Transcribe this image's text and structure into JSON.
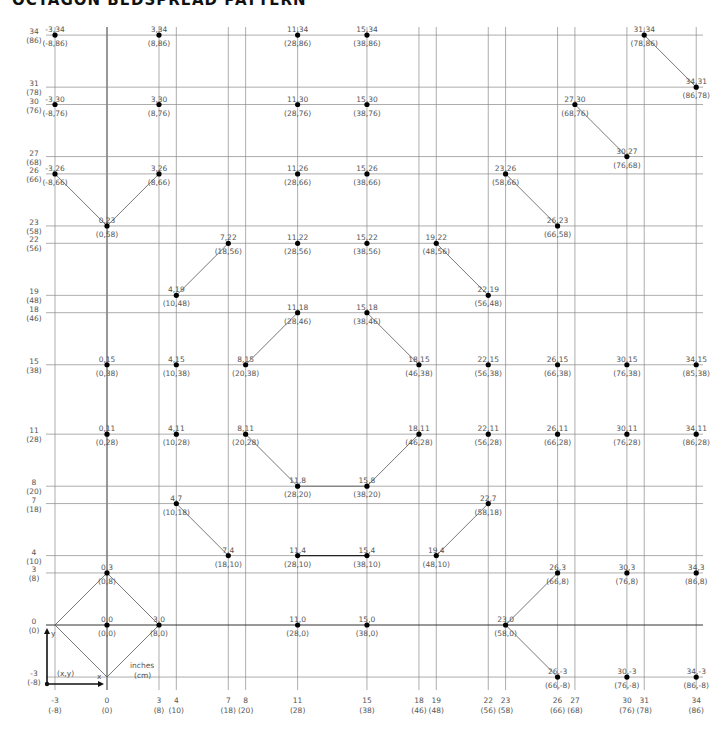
{
  "title": "OCTAGON BEDSPREAD PATTERN",
  "legend": {
    "xy_label": "(x,y)",
    "x_label": "x",
    "y_label": "y",
    "units_inches": "inches",
    "units_cm": "(cm)"
  },
  "axes": {
    "x_ticks": [
      {
        "v": -3,
        "in": "-3",
        "cm": "(-8)"
      },
      {
        "v": 0,
        "in": "0",
        "cm": "(0)"
      },
      {
        "v": 3,
        "in": "3",
        "cm": "(8)"
      },
      {
        "v": 4,
        "in": "4",
        "cm": "(10)"
      },
      {
        "v": 7,
        "in": "7",
        "cm": "(18)"
      },
      {
        "v": 8,
        "in": "8",
        "cm": "(20)"
      },
      {
        "v": 11,
        "in": "11",
        "cm": "(28)"
      },
      {
        "v": 15,
        "in": "15",
        "cm": "(38)"
      },
      {
        "v": 18,
        "in": "18",
        "cm": "(46)"
      },
      {
        "v": 19,
        "in": "19",
        "cm": "(48)"
      },
      {
        "v": 22,
        "in": "22",
        "cm": "(56)"
      },
      {
        "v": 23,
        "in": "23",
        "cm": "(58)"
      },
      {
        "v": 26,
        "in": "26",
        "cm": "(66)"
      },
      {
        "v": 27,
        "in": "27",
        "cm": "(68)"
      },
      {
        "v": 30,
        "in": "30",
        "cm": "(76)"
      },
      {
        "v": 31,
        "in": "31",
        "cm": "(78)"
      },
      {
        "v": 34,
        "in": "34",
        "cm": "(86)"
      }
    ],
    "y_ticks": [
      {
        "v": 34,
        "in": "34",
        "cm": "(86)"
      },
      {
        "v": 31,
        "in": "31",
        "cm": "(78)"
      },
      {
        "v": 30,
        "in": "30",
        "cm": "(76)"
      },
      {
        "v": 27,
        "in": "27",
        "cm": "(68)"
      },
      {
        "v": 26,
        "in": "26",
        "cm": "(66)"
      },
      {
        "v": 23,
        "in": "23",
        "cm": "(58)"
      },
      {
        "v": 22,
        "in": "22",
        "cm": "(56)"
      },
      {
        "v": 19,
        "in": "19",
        "cm": "(48)"
      },
      {
        "v": 18,
        "in": "18",
        "cm": "(46)"
      },
      {
        "v": 15,
        "in": "15",
        "cm": "(38)"
      },
      {
        "v": 11,
        "in": "11",
        "cm": "(28)"
      },
      {
        "v": 8,
        "in": "8",
        "cm": "(20)"
      },
      {
        "v": 7,
        "in": "7",
        "cm": "(18)"
      },
      {
        "v": 4,
        "in": "4",
        "cm": "(10)"
      },
      {
        "v": 3,
        "in": "3",
        "cm": "(8)"
      },
      {
        "v": 0,
        "in": "0",
        "cm": "(0)"
      },
      {
        "v": -3,
        "in": "-3",
        "cm": "(-8)"
      }
    ]
  },
  "points": [
    {
      "x": -3,
      "y": 34,
      "in": "-3,34",
      "cm": "(-8,86)"
    },
    {
      "x": 3,
      "y": 34,
      "in": "3,34",
      "cm": "(8,86)"
    },
    {
      "x": 11,
      "y": 34,
      "in": "11,34",
      "cm": "(28,86)"
    },
    {
      "x": 15,
      "y": 34,
      "in": "15,34",
      "cm": "(38,86)"
    },
    {
      "x": 31,
      "y": 34,
      "in": "31,34",
      "cm": "(78,86)"
    },
    {
      "x": 34,
      "y": 31,
      "in": "34,31",
      "cm": "(86,78)"
    },
    {
      "x": -3,
      "y": 30,
      "in": "-3,30",
      "cm": "(-8,76)"
    },
    {
      "x": 3,
      "y": 30,
      "in": "3,30",
      "cm": "(8,76)"
    },
    {
      "x": 11,
      "y": 30,
      "in": "11,30",
      "cm": "(28,76)"
    },
    {
      "x": 15,
      "y": 30,
      "in": "15,30",
      "cm": "(38,76)"
    },
    {
      "x": 27,
      "y": 30,
      "in": "27,30",
      "cm": "(68,76)"
    },
    {
      "x": 30,
      "y": 27,
      "in": "30,27",
      "cm": "(76,68)"
    },
    {
      "x": -3,
      "y": 26,
      "in": "-3,26",
      "cm": "(-8,66)"
    },
    {
      "x": 3,
      "y": 26,
      "in": "3,26",
      "cm": "(8,66)"
    },
    {
      "x": 11,
      "y": 26,
      "in": "11,26",
      "cm": "(28,66)"
    },
    {
      "x": 15,
      "y": 26,
      "in": "15,26",
      "cm": "(38,66)"
    },
    {
      "x": 23,
      "y": 26,
      "in": "23,26",
      "cm": "(58,66)"
    },
    {
      "x": 0,
      "y": 23,
      "in": "0,23",
      "cm": "(0,58)"
    },
    {
      "x": 26,
      "y": 23,
      "in": "26,23",
      "cm": "(66,58)"
    },
    {
      "x": 7,
      "y": 22,
      "in": "7,22",
      "cm": "(18,56)"
    },
    {
      "x": 11,
      "y": 22,
      "in": "11,22",
      "cm": "(28,56)"
    },
    {
      "x": 15,
      "y": 22,
      "in": "15,22",
      "cm": "(38,56)"
    },
    {
      "x": 19,
      "y": 22,
      "in": "19,22",
      "cm": "(48,56)"
    },
    {
      "x": 4,
      "y": 19,
      "in": "4,19",
      "cm": "(10,48)"
    },
    {
      "x": 22,
      "y": 19,
      "in": "22,19",
      "cm": "(56,48)"
    },
    {
      "x": 11,
      "y": 18,
      "in": "11,18",
      "cm": "(28,46)"
    },
    {
      "x": 15,
      "y": 18,
      "in": "15,18",
      "cm": "(38,46)"
    },
    {
      "x": 0,
      "y": 15,
      "in": "0,15",
      "cm": "(0,38)"
    },
    {
      "x": 4,
      "y": 15,
      "in": "4,15",
      "cm": "(10,38)"
    },
    {
      "x": 8,
      "y": 15,
      "in": "8,15",
      "cm": "(20,38)"
    },
    {
      "x": 18,
      "y": 15,
      "in": "18,15",
      "cm": "(46,38)"
    },
    {
      "x": 22,
      "y": 15,
      "in": "22,15",
      "cm": "(56,38)"
    },
    {
      "x": 26,
      "y": 15,
      "in": "26,15",
      "cm": "(66,38)"
    },
    {
      "x": 30,
      "y": 15,
      "in": "30,15",
      "cm": "(76,38)"
    },
    {
      "x": 34,
      "y": 15,
      "in": "34,15",
      "cm": "(85,38)"
    },
    {
      "x": 0,
      "y": 11,
      "in": "0,11",
      "cm": "(0,28)"
    },
    {
      "x": 4,
      "y": 11,
      "in": "4,11",
      "cm": "(10,28)"
    },
    {
      "x": 8,
      "y": 11,
      "in": "8,11",
      "cm": "(20,28)"
    },
    {
      "x": 18,
      "y": 11,
      "in": "18,11",
      "cm": "(46,28)"
    },
    {
      "x": 22,
      "y": 11,
      "in": "22,11",
      "cm": "(56,28)"
    },
    {
      "x": 26,
      "y": 11,
      "in": "26,11",
      "cm": "(66,28)"
    },
    {
      "x": 30,
      "y": 11,
      "in": "30,11",
      "cm": "(76,28)"
    },
    {
      "x": 34,
      "y": 11,
      "in": "34,11",
      "cm": "(86,28)"
    },
    {
      "x": 11,
      "y": 8,
      "in": "11,8",
      "cm": "(28,20)"
    },
    {
      "x": 15,
      "y": 8,
      "in": "15,8",
      "cm": "(38,20)"
    },
    {
      "x": 4,
      "y": 7,
      "in": "4,7",
      "cm": "(10,18)"
    },
    {
      "x": 22,
      "y": 7,
      "in": "22,7",
      "cm": "(58,18)"
    },
    {
      "x": 7,
      "y": 4,
      "in": "7,4",
      "cm": "(18,10)"
    },
    {
      "x": 11,
      "y": 4,
      "in": "11,4",
      "cm": "(28,10)"
    },
    {
      "x": 15,
      "y": 4,
      "in": "15,4",
      "cm": "(38,10)"
    },
    {
      "x": 19,
      "y": 4,
      "in": "19,4",
      "cm": "(48,10)"
    },
    {
      "x": 0,
      "y": 3,
      "in": "0,3",
      "cm": "(0,8)"
    },
    {
      "x": 26,
      "y": 3,
      "in": "26,3",
      "cm": "(66,8)"
    },
    {
      "x": 30,
      "y": 3,
      "in": "30,3",
      "cm": "(76,8)"
    },
    {
      "x": 34,
      "y": 3,
      "in": "34,3",
      "cm": "(86,8)"
    },
    {
      "x": 0,
      "y": 0,
      "in": "0,0",
      "cm": "(0,0)"
    },
    {
      "x": 3,
      "y": 0,
      "in": "3,0",
      "cm": "(8,0)"
    },
    {
      "x": 11,
      "y": 0,
      "in": "11,0",
      "cm": "(28,0)"
    },
    {
      "x": 15,
      "y": 0,
      "in": "15,0",
      "cm": "(38,0)"
    },
    {
      "x": 23,
      "y": 0,
      "in": "23,0",
      "cm": "(58,0)"
    },
    {
      "x": 26,
      "y": -3,
      "in": "26,-3",
      "cm": "(66,-8)"
    },
    {
      "x": 30,
      "y": -3,
      "in": "30,-3",
      "cm": "(76,-8)"
    },
    {
      "x": 34,
      "y": -3,
      "in": "34,-3",
      "cm": "(86,-8)"
    }
  ],
  "segments": [
    {
      "a": [
        -3,
        26
      ],
      "b": [
        0,
        23
      ]
    },
    {
      "a": [
        0,
        23
      ],
      "b": [
        3,
        26
      ]
    },
    {
      "a": [
        27,
        30
      ],
      "b": [
        30,
        27
      ]
    },
    {
      "a": [
        31,
        34
      ],
      "b": [
        34,
        31
      ]
    },
    {
      "a": [
        23,
        26
      ],
      "b": [
        26,
        23
      ]
    },
    {
      "a": [
        19,
        22
      ],
      "b": [
        22,
        19
      ]
    },
    {
      "a": [
        4,
        19
      ],
      "b": [
        7,
        22
      ]
    },
    {
      "a": [
        8,
        15
      ],
      "b": [
        11,
        18
      ]
    },
    {
      "a": [
        15,
        18
      ],
      "b": [
        18,
        15
      ]
    },
    {
      "a": [
        8,
        11
      ],
      "b": [
        11,
        8
      ]
    },
    {
      "a": [
        15,
        8
      ],
      "b": [
        18,
        11
      ]
    },
    {
      "a": [
        11,
        8
      ],
      "b": [
        15,
        8
      ]
    },
    {
      "a": [
        4,
        7
      ],
      "b": [
        7,
        4
      ]
    },
    {
      "a": [
        19,
        4
      ],
      "b": [
        22,
        7
      ]
    },
    {
      "a": [
        11,
        4
      ],
      "b": [
        15,
        4
      ],
      "dark": true
    },
    {
      "a": [
        -3,
        0
      ],
      "b": [
        0,
        3
      ]
    },
    {
      "a": [
        0,
        3
      ],
      "b": [
        3,
        0
      ]
    },
    {
      "a": [
        3,
        0
      ],
      "b": [
        0,
        -3
      ]
    },
    {
      "a": [
        0,
        -3
      ],
      "b": [
        -3,
        0
      ]
    },
    {
      "a": [
        23,
        0
      ],
      "b": [
        26,
        3
      ]
    },
    {
      "a": [
        23,
        0
      ],
      "b": [
        26,
        -3
      ]
    }
  ],
  "chart_data": {
    "type": "scatter",
    "title": "OCTAGON BEDSPREAD PATTERN",
    "xlabel": "inches (cm)",
    "ylabel": "inches (cm)",
    "xlim": [
      -3,
      34
    ],
    "ylim": [
      -3,
      34
    ],
    "grid": true
  }
}
